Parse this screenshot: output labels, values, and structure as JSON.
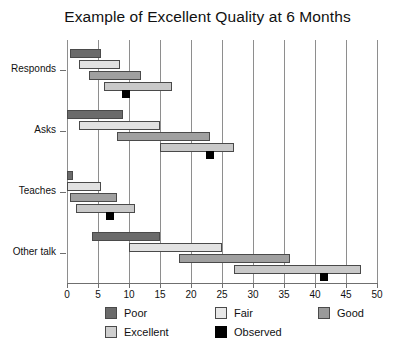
{
  "chart_data": {
    "type": "bar",
    "subtype": "horizontal-range-bar",
    "title": "Example of Excellent Quality at 6 Months",
    "xlabel": "",
    "ylabel": "",
    "xlim": [
      0,
      50
    ],
    "ylim": [
      0,
      4
    ],
    "xticks": [
      0,
      5,
      10,
      15,
      20,
      25,
      30,
      35,
      40,
      45,
      50
    ],
    "xticklabels": [
      "0",
      "5",
      "10",
      "15",
      "20",
      "25",
      "30",
      "35",
      "40",
      "45",
      "50"
    ],
    "categories": [
      "Responds",
      "Asks",
      "Teaches",
      "Other talk"
    ],
    "grid": "vertical",
    "legend_position": "bottom",
    "legend": [
      {
        "name": "Poor",
        "color": "#6b6b6b"
      },
      {
        "name": "Fair",
        "color": "#e8e8e8"
      },
      {
        "name": "Good",
        "color": "#9a9a9a"
      },
      {
        "name": "Excellent",
        "color": "#cfcfcf"
      },
      {
        "name": "Observed",
        "color": "#000000"
      }
    ],
    "series": [
      {
        "name": "Poor",
        "color": "#6b6b6b",
        "ranges": [
          {
            "category": "Responds",
            "start": 0.5,
            "end": 5.5
          },
          {
            "category": "Asks",
            "start": 0.0,
            "end": 9.0
          },
          {
            "category": "Teaches",
            "start": 0.0,
            "end": 1.0
          },
          {
            "category": "Other talk",
            "start": 4.0,
            "end": 15.0
          }
        ]
      },
      {
        "name": "Fair",
        "color": "#e2e2e2",
        "ranges": [
          {
            "category": "Responds",
            "start": 2.0,
            "end": 8.5
          },
          {
            "category": "Asks",
            "start": 2.0,
            "end": 15.0
          },
          {
            "category": "Teaches",
            "start": 0.0,
            "end": 5.5
          },
          {
            "category": "Other talk",
            "start": 10.0,
            "end": 25.0
          }
        ]
      },
      {
        "name": "Good",
        "color": "#a0a0a0",
        "ranges": [
          {
            "category": "Responds",
            "start": 3.5,
            "end": 12.0
          },
          {
            "category": "Asks",
            "start": 8.0,
            "end": 23.0
          },
          {
            "category": "Teaches",
            "start": 0.5,
            "end": 8.0
          },
          {
            "category": "Other talk",
            "start": 18.0,
            "end": 36.0
          }
        ]
      },
      {
        "name": "Excellent",
        "color": "#c9c9c9",
        "ranges": [
          {
            "category": "Responds",
            "start": 6.0,
            "end": 17.0
          },
          {
            "category": "Asks",
            "start": 15.0,
            "end": 27.0
          },
          {
            "category": "Teaches",
            "start": 1.5,
            "end": 11.0
          },
          {
            "category": "Other talk",
            "start": 27.0,
            "end": 47.5
          }
        ]
      }
    ],
    "observed": {
      "name": "Observed",
      "color": "#000000",
      "points": [
        {
          "category": "Responds",
          "value": 9.5
        },
        {
          "category": "Asks",
          "value": 23.0
        },
        {
          "category": "Teaches",
          "value": 7.0
        },
        {
          "category": "Other talk",
          "value": 41.5
        }
      ]
    }
  }
}
